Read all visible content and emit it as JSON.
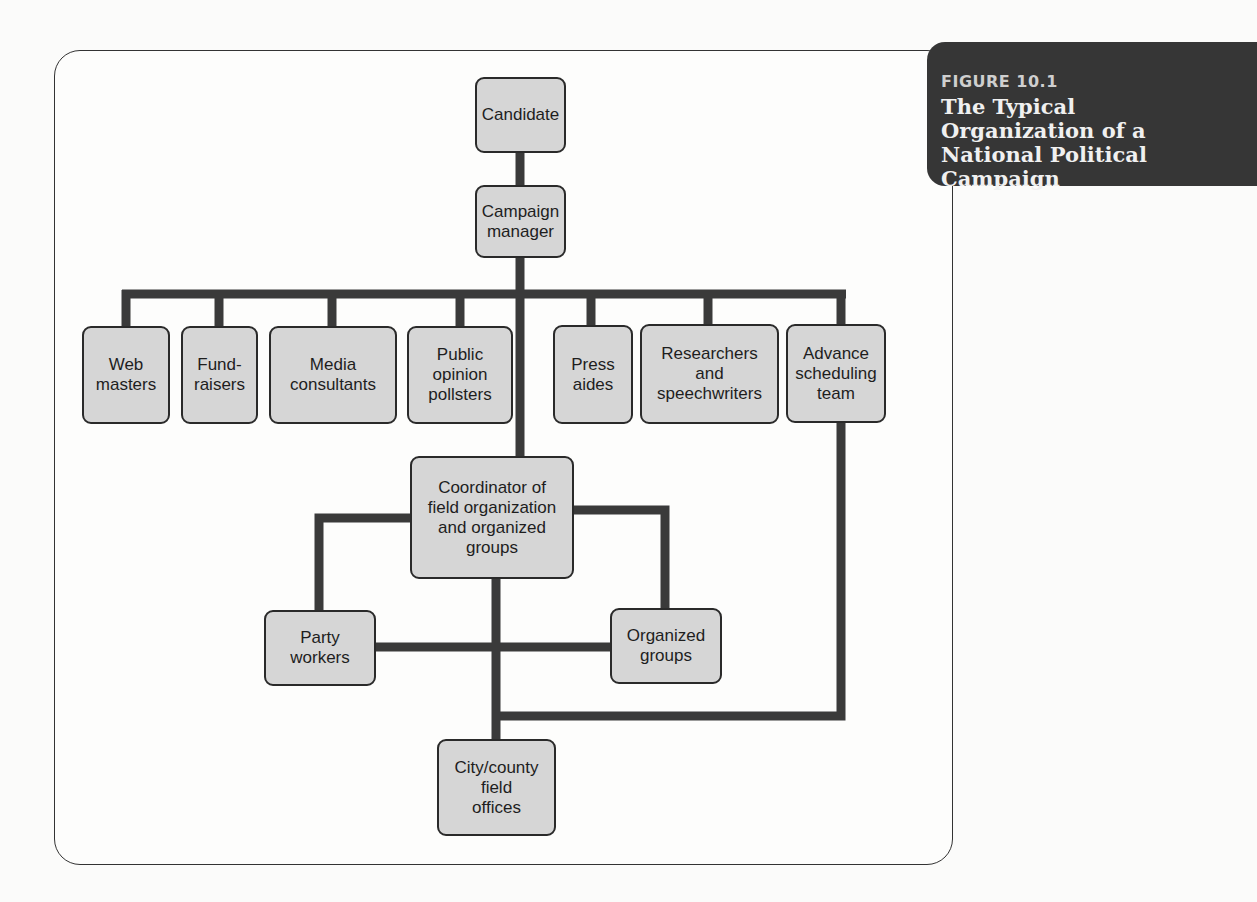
{
  "figure": {
    "label": "FIGURE 10.1",
    "title": "The Typical\nOrganization of a\nNational Political\nCampaign"
  },
  "colors": {
    "node_fill": "#d6d6d6",
    "node_border": "#2a2a2a",
    "connector": "#3a3a3a",
    "title_bg": "#363636"
  },
  "org_chart": {
    "root": "Candidate",
    "manager": "Campaign manager",
    "staff": [
      "Web\nmasters",
      "Fund-\nraisers",
      "Media\nconsultants",
      "Public\nopinion\npollsters",
      "Press\naides",
      "Researchers\nand\nspeechwriters",
      "Advance\nscheduling\nteam"
    ],
    "coordinator": "Coordinator of\nfield organization\nand organized\ngroups",
    "field": {
      "party_workers": "Party\nworkers",
      "organized_groups": "Organized\ngroups",
      "city_county": "City/county\nfield\noffices"
    },
    "relationships": [
      [
        "Candidate",
        "Campaign manager"
      ],
      [
        "Campaign manager",
        "Web masters"
      ],
      [
        "Campaign manager",
        "Fund-raisers"
      ],
      [
        "Campaign manager",
        "Media consultants"
      ],
      [
        "Campaign manager",
        "Public opinion pollsters"
      ],
      [
        "Campaign manager",
        "Press aides"
      ],
      [
        "Campaign manager",
        "Researchers and speechwriters"
      ],
      [
        "Campaign manager",
        "Advance scheduling team"
      ],
      [
        "Campaign manager",
        "Coordinator of field organization and organized groups"
      ],
      [
        "Coordinator of field organization and organized groups",
        "Party workers"
      ],
      [
        "Coordinator of field organization and organized groups",
        "Organized groups"
      ],
      [
        "Coordinator of field organization and organized groups",
        "City/county field offices"
      ],
      [
        "Party workers",
        "Organized groups"
      ],
      [
        "Advance scheduling team",
        "City/county field offices"
      ]
    ]
  }
}
